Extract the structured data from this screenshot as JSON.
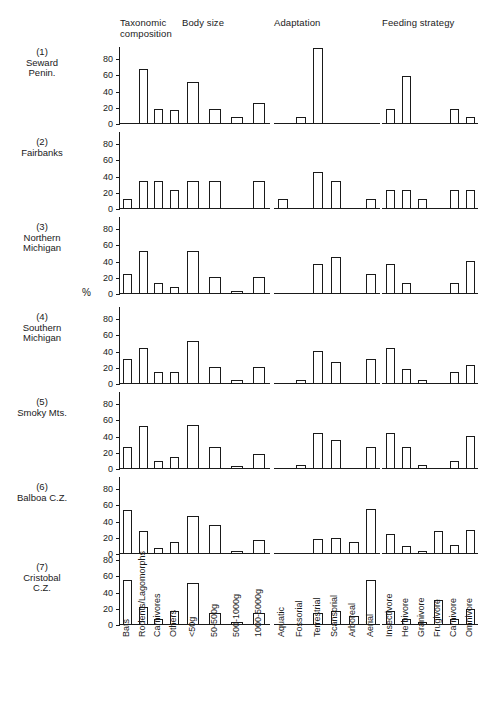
{
  "figure": {
    "y_axis_caption": "%",
    "y_ticks": [
      0,
      20,
      40,
      60,
      80
    ],
    "column_titles": [
      "Taxonomic\ncomposition",
      "Body size",
      "Adaptation",
      "Feeding strategy"
    ],
    "row_labels": [
      "(1)\nSeward\nPenin.",
      "(2)\nFairbanks",
      "(3)\nNorthern\nMichigan",
      "(4)\nSouthern\nMichigan",
      "(5)\nSmoky Mts.",
      "(6)\nBalboa C.Z.",
      "(7)\nCristobal\nC.Z."
    ]
  },
  "chart_data": {
    "type": "bar",
    "title": "",
    "xlabel": "",
    "ylabel": "%",
    "ylim": [
      0,
      95
    ],
    "grid": false,
    "legend": "none",
    "yticks": [
      0,
      20,
      40,
      60,
      80
    ],
    "panel_columns": [
      {
        "name": "Taxonomic composition",
        "categories": [
          "Bats",
          "Rodents/Lagomorphs",
          "Carnivores",
          "Others"
        ]
      },
      {
        "name": "Body size",
        "categories": [
          "<50g",
          "50-500g",
          "500-1000g",
          "1000-5000g"
        ]
      },
      {
        "name": "Adaptation",
        "categories": [
          "Aquatic",
          "Fossorial",
          "Terrestrial",
          "Scansorial",
          "Arboreal",
          "Aerial"
        ]
      },
      {
        "name": "Feeding strategy",
        "categories": [
          "Insectivore",
          "Herbivore",
          "Granivore",
          "Frugivore",
          "Carnivore",
          "Omnivore"
        ]
      }
    ],
    "panel_rows": [
      {
        "name": "(1) Seward Penin.",
        "series": [
          {
            "name": "Taxonomic composition",
            "values": [
              0,
              67,
              17,
              16
            ]
          },
          {
            "name": "Body size",
            "values": [
              50,
              17,
              8,
              25
            ]
          },
          {
            "name": "Adaptation",
            "values": [
              0,
              8,
              92,
              0,
              0,
              0
            ]
          },
          {
            "name": "Feeding strategy",
            "values": [
              17,
              58,
              0,
              0,
              17,
              8
            ]
          }
        ]
      },
      {
        "name": "(2) Fairbanks",
        "series": [
          {
            "name": "Taxonomic composition",
            "values": [
              11,
              33,
              33,
              22
            ]
          },
          {
            "name": "Body size",
            "values": [
              33,
              33,
              0,
              33
            ]
          },
          {
            "name": "Adaptation",
            "values": [
              11,
              0,
              44,
              33,
              0,
              11
            ]
          },
          {
            "name": "Feeding strategy",
            "values": [
              22,
              22,
              11,
              0,
              22,
              22
            ]
          }
        ]
      },
      {
        "name": "(3) Northern Michigan",
        "series": [
          {
            "name": "Taxonomic composition",
            "values": [
              24,
              52,
              12,
              8
            ]
          },
          {
            "name": "Body size",
            "values": [
              52,
              20,
              1,
              20
            ]
          },
          {
            "name": "Adaptation",
            "values": [
              0,
              0,
              36,
              44,
              0,
              24
            ]
          },
          {
            "name": "Feeding strategy",
            "values": [
              36,
              12,
              0,
              0,
              12,
              40
            ]
          }
        ]
      },
      {
        "name": "(4) Southern Michigan",
        "series": [
          {
            "name": "Taxonomic composition",
            "values": [
              30,
              43,
              13,
              13
            ]
          },
          {
            "name": "Body size",
            "values": [
              52,
              20,
              4,
              20
            ]
          },
          {
            "name": "Adaptation",
            "values": [
              0,
              4,
              39,
              26,
              0,
              30
            ]
          },
          {
            "name": "Feeding strategy",
            "values": [
              43,
              17,
              4,
              0,
              13,
              22
            ]
          }
        ]
      },
      {
        "name": "(5) Smoky Mts.",
        "series": [
          {
            "name": "Taxonomic composition",
            "values": [
              26,
              52,
              9,
              13
            ]
          },
          {
            "name": "Body size",
            "values": [
              53,
              26,
              3,
              17
            ]
          },
          {
            "name": "Adaptation",
            "values": [
              0,
              4,
              43,
              35,
              0,
              26
            ]
          },
          {
            "name": "Feeding strategy",
            "values": [
              43,
              26,
              4,
              0,
              9,
              39
            ]
          }
        ]
      },
      {
        "name": "(6) Balboa C.Z.",
        "series": [
          {
            "name": "Taxonomic composition",
            "values": [
              53,
              27,
              6,
              14
            ]
          },
          {
            "name": "Body size",
            "values": [
              46,
              34,
              3,
              16
            ]
          },
          {
            "name": "Adaptation",
            "values": [
              0,
              0,
              17,
              19,
              14,
              54
            ]
          },
          {
            "name": "Feeding strategy",
            "values": [
              23,
              9,
              3,
              27,
              10,
              28
            ]
          }
        ]
      },
      {
        "name": "(7) Cristobal C.Z.",
        "series": [
          {
            "name": "Taxonomic composition",
            "values": [
              54,
              21,
              6,
              16
            ]
          },
          {
            "name": "Body size",
            "values": [
              50,
              14,
              1,
              13
            ]
          },
          {
            "name": "Adaptation",
            "values": [
              0,
              0,
              13,
              16,
              10,
              54
            ]
          },
          {
            "name": "Feeding strategy",
            "values": [
              16,
              6,
              3,
              30,
              6,
              18
            ]
          }
        ]
      }
    ]
  }
}
